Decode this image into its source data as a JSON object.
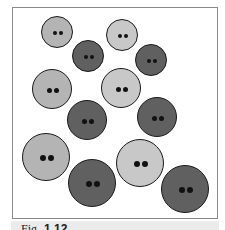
{
  "figure": {
    "frame_color": "#8a8a8a",
    "background": "#ffffff",
    "colors": {
      "light": "#b4b4b4",
      "lighter": "#c8c8c8",
      "dark": "#606060",
      "outline": "#1a1a1a",
      "hole": "#111111"
    },
    "buttons": [
      {
        "id": 1,
        "cx": 57,
        "cy": 32,
        "r": 16,
        "shade": "light"
      },
      {
        "id": 2,
        "cx": 88,
        "cy": 56,
        "r": 16,
        "shade": "dark"
      },
      {
        "id": 3,
        "cx": 122,
        "cy": 35,
        "r": 16,
        "shade": "lighter"
      },
      {
        "id": 4,
        "cx": 151,
        "cy": 60,
        "r": 16,
        "shade": "dark"
      },
      {
        "id": 5,
        "cx": 52,
        "cy": 89,
        "r": 20,
        "shade": "light"
      },
      {
        "id": 6,
        "cx": 87,
        "cy": 120,
        "r": 20,
        "shade": "dark"
      },
      {
        "id": 7,
        "cx": 121,
        "cy": 88,
        "r": 20,
        "shade": "lighter"
      },
      {
        "id": 8,
        "cx": 157,
        "cy": 117,
        "r": 20,
        "shade": "dark"
      },
      {
        "id": 9,
        "cx": 46,
        "cy": 157,
        "r": 24,
        "shade": "light"
      },
      {
        "id": 10,
        "cx": 92,
        "cy": 183,
        "r": 24,
        "shade": "dark"
      },
      {
        "id": 11,
        "cx": 140,
        "cy": 163,
        "r": 24,
        "shade": "lighter"
      },
      {
        "id": 12,
        "cx": 185,
        "cy": 189,
        "r": 24,
        "shade": "dark"
      }
    ]
  },
  "caption": {
    "prefix": "Fig.",
    "number": "1.12"
  }
}
